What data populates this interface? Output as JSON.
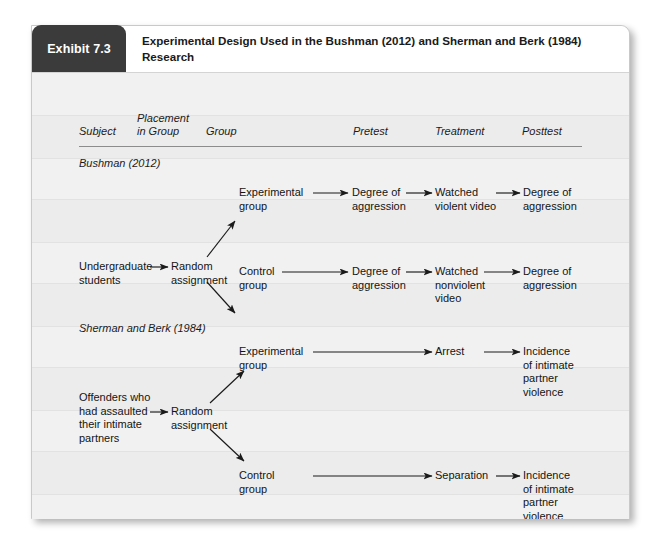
{
  "exhibit": {
    "tab_label": "Exhibit 7.3",
    "title_line1": "Experimental Design Used in the Bushman (2012) and Sherman and Berk (1984)",
    "title_line2": "Research"
  },
  "columns": [
    {
      "label": "Subject"
    },
    {
      "label": "Placement\nin Group"
    },
    {
      "label": "Group"
    },
    {
      "label": "Pretest"
    },
    {
      "label": "Treatment"
    },
    {
      "label": "Posttest"
    }
  ],
  "sections": [
    {
      "label": "Bushman (2012)",
      "nodes": {
        "subject": "Undergraduate\nstudents",
        "placement": "Random\nassignment",
        "exp_group": "Experimental\ngroup",
        "exp_pretest": "Degree of\naggression",
        "exp_treatment": "Watched\nviolent video",
        "exp_posttest": "Degree of\naggression",
        "ctl_group": "Control\ngroup",
        "ctl_pretest": "Degree of\naggression",
        "ctl_treatment": "Watched\nnonviolent\nvideo",
        "ctl_posttest": "Degree of\naggression"
      }
    },
    {
      "label": "Sherman and Berk (1984)",
      "nodes": {
        "subject": "Offenders who\nhad assaulted\ntheir intimate\npartners",
        "placement": "Random\nassignment",
        "exp_group": "Experimental\ngroup",
        "exp_treatment": "Arrest",
        "exp_posttest": "Incidence\nof intimate\npartner\nviolence",
        "ctl_group": "Control\ngroup",
        "ctl_treatment": "Separation",
        "ctl_posttest": "Incidence\nof intimate\npartner\nviolence"
      }
    }
  ],
  "colors": {
    "tab_background": "#3b3b3b",
    "tab_text": "#ffffff",
    "card_background": "#f1f1f1",
    "header_background": "#ffffff",
    "rule": "#8c8c8c",
    "arrow": "#1a1a1a"
  }
}
